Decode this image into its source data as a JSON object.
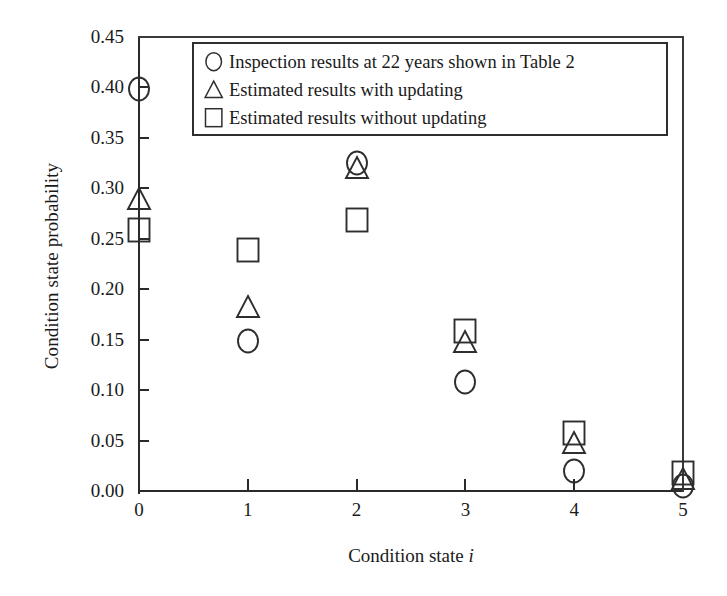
{
  "chart_data": {
    "type": "scatter",
    "title": "",
    "xlabel": "Condition state i",
    "ylabel": "Condition state probability",
    "xlim": [
      0,
      5
    ],
    "ylim": [
      0.0,
      0.45
    ],
    "grid": false,
    "legend_position": "top-right-inside",
    "x_tick_labels": [
      "0",
      "1",
      "2",
      "3",
      "4",
      "5"
    ],
    "x": [
      0,
      1,
      2,
      3,
      4,
      5
    ],
    "y_tick_labels": [
      "0.00",
      "0.05",
      "0.10",
      "0.15",
      "0.20",
      "0.25",
      "0.30",
      "0.35",
      "0.40",
      "0.45"
    ],
    "y_ticks": [
      0.0,
      0.05,
      0.1,
      0.15,
      0.2,
      0.25,
      0.3,
      0.35,
      0.4,
      0.45
    ],
    "series": [
      {
        "name": "Inspection results at 22 years shown in Table 2",
        "marker": "circle",
        "values": [
          0.398,
          0.149,
          0.325,
          0.108,
          0.02,
          0.005
        ]
      },
      {
        "name": "Estimated results with updating",
        "marker": "triangle",
        "values": [
          0.289,
          0.182,
          0.32,
          0.148,
          0.048,
          0.012
        ]
      },
      {
        "name": "Estimated results without updating",
        "marker": "square",
        "values": [
          0.259,
          0.239,
          0.269,
          0.159,
          0.057,
          0.018
        ]
      }
    ]
  },
  "legend": {
    "items": [
      {
        "symbol": "circle-marker-icon",
        "label": "Inspection results at 22 years shown in Table 2"
      },
      {
        "symbol": "triangle-marker-icon",
        "label": "Estimated results with updating"
      },
      {
        "symbol": "square-marker-icon",
        "label": "Estimated results without updating"
      }
    ]
  },
  "colors": {
    "axis": "#2a2a2a",
    "marker": "#2e2e2e",
    "background": "#ffffff"
  }
}
